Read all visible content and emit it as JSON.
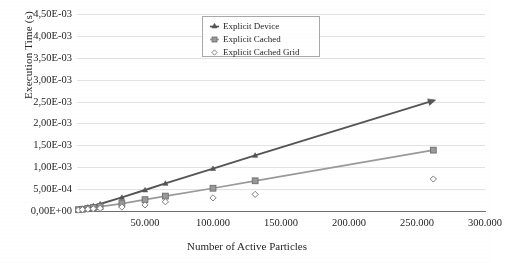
{
  "chart_data": {
    "type": "line",
    "title": "",
    "xlabel": "Number of Active Particles",
    "ylabel": "Execution Time (s)",
    "xlim": [
      0,
      300000
    ],
    "ylim": [
      0,
      0.0045
    ],
    "grid": true,
    "legend_position": "top-center",
    "xticks": [
      "50.000",
      "100.000",
      "150.000",
      "200.000",
      "250.000",
      "300.000"
    ],
    "xtick_values": [
      50000,
      100000,
      150000,
      200000,
      250000,
      300000
    ],
    "yticks": [
      "0,00E+00",
      "5,00E-04",
      "1,00E-03",
      "1,50E-03",
      "2,00E-03",
      "2,50E-03",
      "3,00E-03",
      "3,50E-03",
      "4,00E-03",
      "4,50E-03"
    ],
    "ytick_values": [
      0,
      0.0005,
      0.001,
      0.0015,
      0.002,
      0.0025,
      0.003,
      0.0035,
      0.004,
      0.0045
    ],
    "series": [
      {
        "name": "Explicit Device",
        "marker": "triangle",
        "color": "#555555",
        "x": [
          1000,
          4000,
          8000,
          12000,
          17000,
          33000,
          50000,
          65000,
          100000,
          131000,
          262000
        ],
        "y": [
          4e-05,
          6e-05,
          9e-05,
          0.00012,
          0.00016,
          0.00031,
          0.00048,
          0.00063,
          0.00097,
          0.00127,
          0.00252
        ]
      },
      {
        "name": "Explicit Cached",
        "marker": "square",
        "color": "#9a9a9a",
        "x": [
          1000,
          4000,
          8000,
          12000,
          17000,
          33000,
          50000,
          65000,
          100000,
          131000,
          262000
        ],
        "y": [
          3e-05,
          4e-05,
          6e-05,
          8e-05,
          0.0001,
          0.00017,
          0.00026,
          0.00034,
          0.00052,
          0.00069,
          0.00139
        ]
      },
      {
        "name": "Explicit Cached Grid",
        "marker": "diamond",
        "color": "#7a7a7a",
        "x": [
          1000,
          4000,
          8000,
          12000,
          17000,
          33000,
          50000,
          65000,
          100000,
          131000,
          262000
        ],
        "y": [
          2e-05,
          3e-05,
          4e-05,
          5e-05,
          6e-05,
          9e-05,
          0.00014,
          0.00021,
          0.0003,
          0.00038,
          0.00073
        ]
      }
    ],
    "legend_entries": [
      "Explicit Device",
      "Explicit Cached",
      "Explicit Cached Grid"
    ]
  },
  "legend": {
    "items": [
      {
        "label": "Explicit Device",
        "marker": "triangle-marker-icon"
      },
      {
        "label": "Explicit Cached",
        "marker": "square-marker-icon"
      },
      {
        "label": "Explicit Cached Grid",
        "marker": "diamond-marker-icon"
      }
    ]
  },
  "axes": {
    "y_title": "Execution Time (s)",
    "x_title": "Number of Active Particles"
  }
}
